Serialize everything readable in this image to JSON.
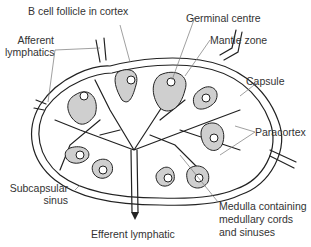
{
  "diagram": {
    "labels": {
      "b_cell_follicle": "B cell follicle in cortex",
      "germinal_centre": "Germinal centre",
      "mantle_zone": "Mantle zone",
      "afferent_1": "Afferent",
      "afferent_2": "lymphatics",
      "capsule": "Capsule",
      "paracortex": "Paracortex",
      "subcapsular_1": "Subcapsular",
      "subcapsular_2": "sinus",
      "medulla_1": "Medulla containing",
      "medulla_2": "medullary cords",
      "medulla_3": "and sinuses",
      "efferent": "Efferent lymphatic"
    },
    "colors": {
      "line": "#222222",
      "follicle_fill": "#cfcfcf",
      "leader": "#777777",
      "text": "#333333"
    }
  }
}
